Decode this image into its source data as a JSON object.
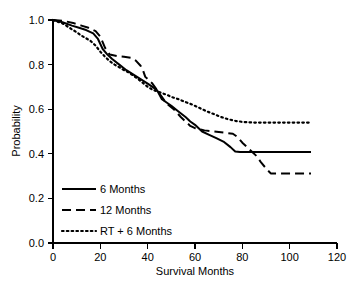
{
  "chart_data": {
    "type": "line",
    "title": "",
    "xlabel": "Survival Months",
    "ylabel": "Probability",
    "xlim": [
      0,
      120
    ],
    "ylim": [
      0.0,
      1.0
    ],
    "grid": false,
    "legend_position": "inside-lower-left",
    "xticks": [
      "0",
      "20",
      "40",
      "60",
      "80",
      "100",
      "120"
    ],
    "xtick_values": [
      0,
      20,
      40,
      60,
      80,
      100,
      120
    ],
    "yticks": [
      "0.0",
      "0.2",
      "0.4",
      "0.6",
      "0.8",
      "1.0"
    ],
    "ytick_values": [
      0.0,
      0.2,
      0.4,
      0.6,
      0.8,
      1.0
    ],
    "series": [
      {
        "name": "6 Months",
        "style": "solid",
        "color": "#000000",
        "x": [
          0,
          4,
          8,
          11,
          14,
          17,
          19,
          21,
          23,
          25,
          28,
          31,
          34,
          37,
          40,
          42,
          44,
          45,
          46,
          48,
          50,
          53,
          56,
          58,
          60,
          63,
          66,
          69,
          72,
          75,
          77,
          79,
          84,
          90,
          96,
          103,
          109
        ],
        "y": [
          1.0,
          0.99,
          0.975,
          0.965,
          0.955,
          0.94,
          0.915,
          0.87,
          0.845,
          0.825,
          0.8,
          0.775,
          0.755,
          0.735,
          0.715,
          0.7,
          0.685,
          0.665,
          0.645,
          0.63,
          0.615,
          0.59,
          0.565,
          0.545,
          0.53,
          0.5,
          0.485,
          0.47,
          0.455,
          0.43,
          0.41,
          0.408,
          0.408,
          0.408,
          0.408,
          0.408,
          0.408
        ]
      },
      {
        "name": "12 Months",
        "style": "dashed",
        "color": "#000000",
        "x": [
          0,
          5,
          9,
          12,
          15,
          18,
          20,
          22,
          24,
          27,
          30,
          33,
          35,
          37,
          38,
          39,
          40,
          42,
          44,
          46,
          48,
          51,
          54,
          56,
          58,
          60,
          64,
          68,
          72,
          76,
          78,
          80,
          83,
          86,
          88,
          90,
          92,
          96,
          102,
          109
        ],
        "y": [
          1.0,
          0.995,
          0.985,
          0.975,
          0.965,
          0.95,
          0.925,
          0.875,
          0.845,
          0.838,
          0.835,
          0.83,
          0.818,
          0.795,
          0.775,
          0.745,
          0.735,
          0.715,
          0.685,
          0.655,
          0.625,
          0.6,
          0.565,
          0.545,
          0.525,
          0.515,
          0.505,
          0.5,
          0.495,
          0.49,
          0.475,
          0.45,
          0.42,
          0.39,
          0.36,
          0.335,
          0.312,
          0.312,
          0.312,
          0.312
        ]
      },
      {
        "name": "RT + 6 Months",
        "style": "dotted",
        "color": "#000000",
        "x": [
          0,
          4,
          7,
          10,
          12,
          14,
          16,
          18,
          20,
          22,
          24,
          26,
          28,
          30,
          32,
          34,
          36,
          38,
          40,
          42,
          44,
          46,
          48,
          50,
          53,
          56,
          59,
          62,
          65,
          68,
          71,
          74,
          77,
          80,
          85,
          90,
          95,
          100,
          105,
          109
        ],
        "y": [
          1.0,
          0.985,
          0.965,
          0.945,
          0.93,
          0.918,
          0.905,
          0.885,
          0.858,
          0.835,
          0.815,
          0.8,
          0.788,
          0.775,
          0.765,
          0.75,
          0.735,
          0.718,
          0.7,
          0.688,
          0.68,
          0.672,
          0.665,
          0.655,
          0.645,
          0.632,
          0.62,
          0.605,
          0.59,
          0.578,
          0.565,
          0.555,
          0.548,
          0.543,
          0.54,
          0.54,
          0.54,
          0.54,
          0.54,
          0.54
        ]
      }
    ]
  },
  "legend": {
    "items": [
      {
        "label": "6 Months",
        "style": "solid"
      },
      {
        "label": "12 Months",
        "style": "dashed"
      },
      {
        "label": "RT + 6 Months",
        "style": "dotted"
      }
    ]
  }
}
